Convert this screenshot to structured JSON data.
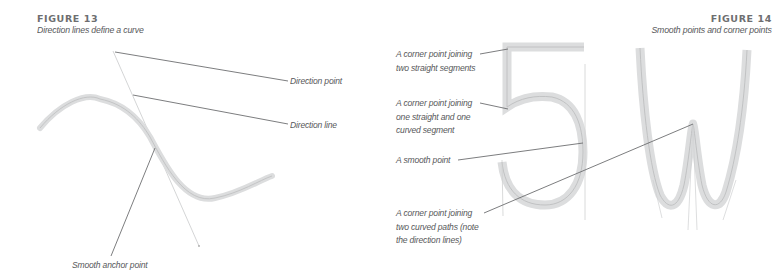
{
  "figure13": {
    "number": "FIGURE 13",
    "caption": "Direction lines define a curve",
    "labels": {
      "direction_point": "Direction point",
      "direction_line": "Direction line",
      "smooth_anchor_point": "Smooth anchor point"
    }
  },
  "figure14": {
    "number": "FIGURE 14",
    "caption": "Smooth points and corner points",
    "glyphs": [
      "5",
      "W"
    ],
    "labels": {
      "corner_two_straight_l1": "A corner point joining",
      "corner_two_straight_l2": "two straight segments",
      "corner_straight_curved_l1": "A corner point joining",
      "corner_straight_curved_l2": "one straight and one",
      "corner_straight_curved_l3": "curved segment",
      "smooth_point": "A smooth point",
      "corner_two_curved_l1": "A corner point joining",
      "corner_two_curved_l2": "two curved paths (note",
      "corner_two_curved_l3": "the direction lines)"
    }
  },
  "colors": {
    "path_stroke": "#d9dadb",
    "path_center": "#b9babb",
    "leader": "#6d6e70",
    "direction_line": "#c8c9ca",
    "text": "#58595b"
  }
}
